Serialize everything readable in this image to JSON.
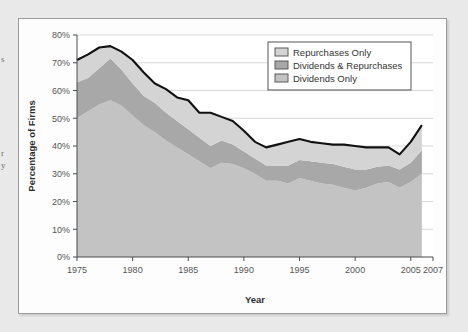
{
  "page_text_fragments": [
    "s",
    "r",
    "y"
  ],
  "figure": {
    "colors": {
      "dividends_only": "#c3c3c3",
      "dividends_and_repurchases": "#a8a8a8",
      "repurchases_only": "#d4d4d4",
      "total_line": "#111111",
      "grid": "#d8d8d8",
      "axis": "#4a4a4a",
      "plot_background": "#ffffff",
      "figure_background": "#fdfdfd",
      "page_background": "#e9e9e9"
    }
  },
  "chart_data": {
    "type": "area",
    "stacked": true,
    "title": "",
    "xlabel": "Year",
    "ylabel": "Percentage of Firms",
    "xlim": [
      1975,
      2007
    ],
    "ylim": [
      0,
      80
    ],
    "grid": true,
    "legend_position": "top-right",
    "y_tick_labels": [
      "0%",
      "10%",
      "20%",
      "30%",
      "40%",
      "50%",
      "60%",
      "70%",
      "80%"
    ],
    "y_tick_values": [
      0,
      10,
      20,
      30,
      40,
      50,
      60,
      70,
      80
    ],
    "x_tick_labels": [
      "1975",
      "1980",
      "1985",
      "1990",
      "1995",
      "2000",
      "2005",
      "2007"
    ],
    "x_tick_values": [
      1975,
      1980,
      1985,
      1990,
      1995,
      2000,
      2005,
      2007
    ],
    "x": [
      1975,
      1976,
      1977,
      1978,
      1979,
      1980,
      1981,
      1982,
      1983,
      1984,
      1985,
      1986,
      1987,
      1988,
      1989,
      1990,
      1991,
      1992,
      1993,
      1994,
      1995,
      1996,
      1997,
      1998,
      1999,
      2000,
      2001,
      2002,
      2003,
      2004,
      2005,
      2006
    ],
    "series": [
      {
        "name": "Dividends Only",
        "color": "#c3c3c3",
        "values": [
          50.0,
          52.5,
          55.0,
          56.5,
          54.5,
          51.0,
          47.5,
          45.0,
          42.0,
          39.5,
          37.0,
          34.5,
          32.0,
          34.0,
          33.5,
          32.0,
          30.0,
          27.5,
          27.5,
          26.5,
          28.5,
          27.5,
          26.5,
          26.0,
          25.0,
          24.0,
          25.0,
          26.5,
          27.0,
          25.0,
          27.0,
          30.0
        ]
      },
      {
        "name": "Dividends & Repurchases",
        "color": "#a8a8a8",
        "values": [
          13.0,
          12.0,
          13.0,
          15.0,
          13.0,
          11.5,
          10.5,
          10.5,
          10.0,
          9.5,
          9.0,
          8.5,
          8.0,
          8.0,
          7.0,
          6.0,
          5.5,
          5.5,
          5.5,
          6.5,
          6.5,
          7.0,
          7.5,
          7.5,
          7.5,
          7.5,
          6.5,
          6.0,
          6.0,
          6.5,
          7.0,
          8.5
        ]
      },
      {
        "name": "Repurchases Only",
        "color": "#d4d4d4",
        "values": [
          8.0,
          8.5,
          7.5,
          4.5,
          6.5,
          8.5,
          8.5,
          7.0,
          8.5,
          8.5,
          10.5,
          9.0,
          12.0,
          8.5,
          8.5,
          7.5,
          6.0,
          6.5,
          7.5,
          8.5,
          7.5,
          7.0,
          7.0,
          7.0,
          8.0,
          8.5,
          8.0,
          7.0,
          6.5,
          5.5,
          7.5,
          9.0
        ]
      }
    ],
    "total_values": [
      71.0,
      73.0,
      75.5,
      76.0,
      74.0,
      71.0,
      66.5,
      62.5,
      60.5,
      57.5,
      56.5,
      52.0,
      52.0,
      50.5,
      49.0,
      45.5,
      41.5,
      39.5,
      40.5,
      41.5,
      42.5,
      41.5,
      41.0,
      40.5,
      40.5,
      40.0,
      39.5,
      39.5,
      39.5,
      37.0,
      41.5,
      47.5
    ],
    "total_series_name": "Total (all payers)"
  }
}
